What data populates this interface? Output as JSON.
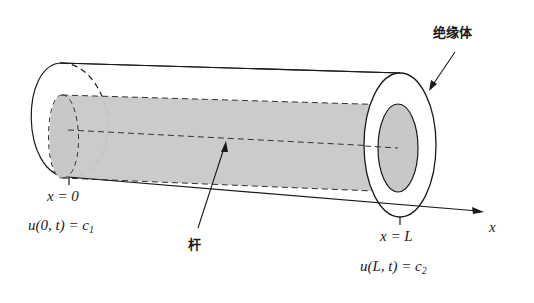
{
  "diagram": {
    "title": "",
    "labels": {
      "insulator": "绝缘体",
      "rod": "杆",
      "axis": "x",
      "left_position": "x = 0",
      "right_position": "x = L",
      "left_boundary": {
        "prefix": "u(0, t) = c",
        "sub": "1"
      },
      "right_boundary": {
        "prefix": "u(L, t) = c",
        "sub": "2"
      }
    },
    "colors": {
      "line": "#1a1a1a",
      "rod_fill": "#c8c8c8",
      "background": "#ffffff"
    }
  }
}
